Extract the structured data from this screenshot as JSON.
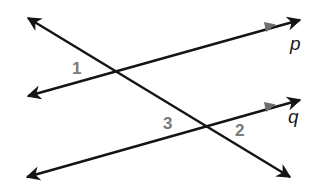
{
  "diagram": {
    "colors": {
      "line": "#141414",
      "parallel_marker": "#6e6e6e",
      "angle_label": "#7a7a7a",
      "line_label": "#1a1a1a",
      "background": "#ffffff"
    },
    "lines": [
      {
        "id": "transversal",
        "label": "",
        "from": [
          28,
          18
        ],
        "to": [
          290,
          177
        ],
        "arrows": "both",
        "parallel_marker": false
      },
      {
        "id": "p",
        "label": "p",
        "from": [
          28,
          96
        ],
        "to": [
          300,
          20
        ],
        "arrows": "both",
        "parallel_marker": true
      },
      {
        "id": "q",
        "label": "q",
        "from": [
          27,
          177
        ],
        "to": [
          300,
          100
        ],
        "arrows": "both",
        "parallel_marker": true
      }
    ],
    "line_labels": [
      {
        "text": "p",
        "x": 290,
        "y": 50
      },
      {
        "text": "q",
        "x": 288,
        "y": 123
      }
    ],
    "angle_labels": [
      {
        "text": "1",
        "x": 72,
        "y": 74
      },
      {
        "text": "3",
        "x": 163,
        "y": 129
      },
      {
        "text": "2",
        "x": 235,
        "y": 136
      }
    ]
  }
}
